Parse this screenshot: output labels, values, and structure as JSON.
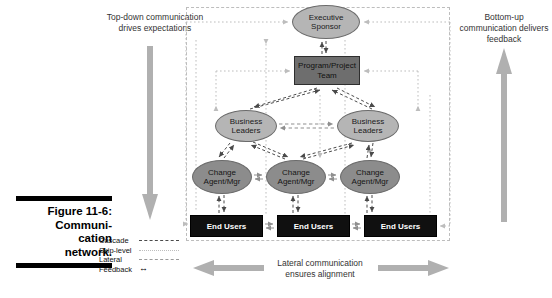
{
  "figure": {
    "caption_label": "Figure 11-6:",
    "caption_title": "Communi-cation network.",
    "caption_line1": "Figure 11-6:",
    "caption_line2": "Communi-",
    "caption_line3": "cation",
    "caption_line4": "network."
  },
  "annotations": {
    "top_down": "Top-down communication drives expectations",
    "bottom_up": "Bottom-up communication delivers feedback",
    "lateral": "Lateral communication ensures alignment"
  },
  "legend": {
    "items": [
      {
        "label": "Cascade",
        "style": "dashed-dark",
        "color": "#4a4a4a"
      },
      {
        "label": "Skip-level",
        "style": "dotted-light",
        "color": "#bdbdbd"
      },
      {
        "label": "Lateral",
        "style": "dashed-medium",
        "color": "#9a9a9a"
      },
      {
        "label": "Feedback",
        "style": "double-arrow",
        "color": "#000000",
        "glyph": "↔"
      }
    ]
  },
  "diagram": {
    "nodes": {
      "executive_sponsor": {
        "label_line1": "Executive",
        "label_line2": "Sponsor",
        "shape": "ellipse",
        "fill": "#b5b5b5"
      },
      "program_team": {
        "label_line1": "Program/Project",
        "label_line2": "Team",
        "shape": "rectangle",
        "fill": "#6e6e6e"
      },
      "business_leaders_left": {
        "label_line1": "Business",
        "label_line2": "Leaders",
        "shape": "ellipse",
        "fill": "#b5b5b5"
      },
      "business_leaders_right": {
        "label_line1": "Business",
        "label_line2": "Leaders",
        "shape": "ellipse",
        "fill": "#b5b5b5"
      },
      "change_agent_1": {
        "label_line1": "Change",
        "label_line2": "Agent/Mgr",
        "shape": "ellipse",
        "fill": "#8c8c8c"
      },
      "change_agent_2": {
        "label_line1": "Change",
        "label_line2": "Agent/Mgr",
        "shape": "ellipse",
        "fill": "#8c8c8c"
      },
      "change_agent_3": {
        "label_line1": "Change",
        "label_line2": "Agent/Mgr",
        "shape": "ellipse",
        "fill": "#8c8c8c"
      },
      "end_users_1": {
        "label": "End Users",
        "shape": "rectangle",
        "fill": "#101010"
      },
      "end_users_2": {
        "label": "End Users",
        "shape": "rectangle",
        "fill": "#101010"
      },
      "end_users_3": {
        "label": "End Users",
        "shape": "rectangle",
        "fill": "#101010"
      }
    }
  },
  "colors": {
    "cascade": "#4a4a4a",
    "skip_level": "#bdbdbd",
    "lateral": "#9a9a9a",
    "big_arrow": "#b0b0b0",
    "frame_border": "#bdbdbd"
  }
}
